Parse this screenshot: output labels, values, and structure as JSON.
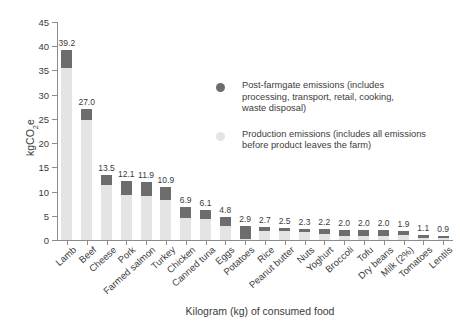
{
  "chart_data": {
    "type": "bar",
    "title": "",
    "subtitle": "",
    "xlabel": "Kilogram (kg) of consumed food",
    "ylabel": "kgCO2e",
    "ylabel_html": "kgCO<sub>2</sub>e",
    "ylim": [
      0,
      45
    ],
    "yticks": [
      0,
      5,
      10,
      15,
      20,
      25,
      30,
      35,
      40,
      45
    ],
    "grid": false,
    "stacked": true,
    "legend_position": "inside-upper-right",
    "categories": [
      "Lamb",
      "Beef",
      "Cheese",
      "Pork",
      "Farmed salmon",
      "Turkey",
      "Chicken",
      "Canned tuna",
      "Eggs",
      "Potatoes",
      "Rice",
      "Peanut butter",
      "Nuts",
      "Yoghurt",
      "Broccoli",
      "Tofu",
      "Dry beans",
      "Milk (2%)",
      "Tomatoes",
      "Lentils"
    ],
    "totals": [
      39.2,
      27.0,
      13.5,
      12.1,
      11.9,
      10.9,
      6.9,
      6.1,
      4.8,
      2.9,
      2.7,
      2.5,
      2.3,
      2.2,
      2.0,
      2.0,
      2.0,
      1.9,
      1.1,
      0.9
    ],
    "value_labels": [
      "39.2",
      "27.0",
      "13.5",
      "12.1",
      "11.9",
      "10.9",
      "6.9",
      "6.1",
      "4.8",
      "2.9",
      "2.7",
      "2.5",
      "2.3",
      "2.2",
      "2.0",
      "2.0",
      "2.0",
      "1.9",
      "1.1",
      "0.9"
    ],
    "series": [
      {
        "name": "Production emissions (includes all emissions before product leaves the farm)",
        "key": "production",
        "color": "#e4e4e4",
        "values": [
          35.5,
          24.8,
          11.3,
          9.3,
          9.0,
          8.2,
          4.6,
          4.3,
          2.9,
          0.3,
          1.9,
          1.8,
          1.6,
          1.3,
          0.9,
          0.9,
          0.9,
          1.0,
          0.5,
          0.4
        ]
      },
      {
        "name": "Post-farmgate emissions (includes processing, transport, retail, cooking, waste disposal)",
        "key": "post_farmgate",
        "color": "#6d6d6d",
        "values": [
          3.7,
          2.2,
          2.2,
          2.8,
          2.9,
          2.7,
          2.3,
          1.8,
          1.9,
          2.6,
          0.8,
          0.7,
          0.7,
          0.9,
          1.1,
          1.1,
          1.1,
          0.9,
          0.6,
          0.5
        ]
      }
    ]
  },
  "legend": {
    "items": [
      {
        "marker": "post-farmgate-dot",
        "lines": [
          "Post-farmgate emissions (includes",
          "processing, transport, retail, cooking,",
          "waste disposal)"
        ]
      },
      {
        "marker": "production-dot",
        "lines": [
          "Production emissions (includes all emissions",
          "before product leaves the farm)"
        ]
      }
    ]
  }
}
